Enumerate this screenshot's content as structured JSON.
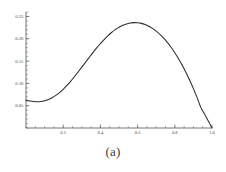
{
  "caption": "(a)",
  "colors": {
    "curve": "#2b2b2b",
    "axis": "#3a3a3a",
    "tick_label": "#4a4a4a",
    "background": "#ffffff"
  },
  "chart_data": {
    "type": "line",
    "title": "",
    "subtitle": "",
    "xlabel": "",
    "ylabel": "",
    "xlim": [
      0.0,
      1.0
    ],
    "ylim": [
      0.0,
      0.26
    ],
    "grid": false,
    "legend": null,
    "legend_position": "none",
    "x_ticks": [
      0.2,
      0.4,
      0.6,
      0.8,
      1.0
    ],
    "x_tick_labels": [
      "0.2",
      "0.4",
      "0.6",
      "0.8",
      "1.0"
    ],
    "x_minor_tick_step": 0.05,
    "y_ticks": [
      0.05,
      0.1,
      0.15,
      0.2,
      0.25
    ],
    "y_tick_labels": [
      "0.05",
      "0.10",
      "0.15",
      "0.20",
      "0.25"
    ],
    "y_minor_tick_step": 0.01,
    "series": [
      {
        "name": "curve",
        "x": [
          0.0,
          0.02,
          0.04,
          0.06,
          0.08,
          0.1,
          0.12,
          0.14,
          0.16,
          0.18,
          0.2,
          0.22,
          0.24,
          0.26,
          0.28,
          0.3,
          0.32,
          0.34,
          0.36,
          0.38,
          0.4,
          0.42,
          0.44,
          0.46,
          0.48,
          0.5,
          0.52,
          0.54,
          0.56,
          0.58,
          0.6,
          0.62,
          0.64,
          0.66,
          0.68,
          0.7,
          0.72,
          0.74,
          0.76,
          0.78,
          0.8,
          0.82,
          0.84,
          0.86,
          0.88,
          0.9,
          0.92,
          0.94,
          0.96,
          0.98,
          1.0
        ],
        "y": [
          0.0625,
          0.0605,
          0.0593,
          0.059,
          0.0596,
          0.0612,
          0.064,
          0.0679,
          0.073,
          0.0793,
          0.0868,
          0.0953,
          0.1047,
          0.1148,
          0.1254,
          0.1363,
          0.1473,
          0.1583,
          0.1691,
          0.1794,
          0.1892,
          0.1983,
          0.2066,
          0.214,
          0.2204,
          0.2258,
          0.2301,
          0.2333,
          0.2353,
          0.2362,
          0.2359,
          0.2345,
          0.2319,
          0.2281,
          0.2232,
          0.2171,
          0.2099,
          0.2014,
          0.1918,
          0.1809,
          0.1688,
          0.1554,
          0.1407,
          0.1246,
          0.1071,
          0.0883,
          0.068,
          0.0462,
          0.0311,
          0.0157,
          0.0
        ]
      }
    ],
    "annotations": [],
    "features": {
      "start_value": 0.0625,
      "local_minimum_x": 0.06,
      "local_minimum_y": 0.059,
      "peak_x": 0.58,
      "peak_y": 0.2362,
      "end_x": 1.0,
      "end_value": 0.0
    }
  }
}
